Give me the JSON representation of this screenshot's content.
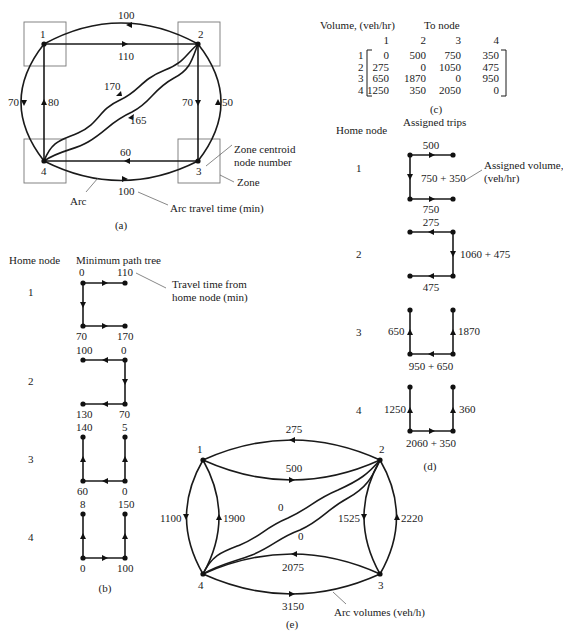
{
  "panel_a": {
    "caption": "(a)",
    "nodes": [
      "1",
      "2",
      "3",
      "4"
    ],
    "arc_times": {
      "outer_2_to_1": "100",
      "inner_1_to_2": "110",
      "outer_1_to_4": "70",
      "inner_4_to_1": "80",
      "diag_4_to_2": "170",
      "diag_2_to_4": "165",
      "inner_2_to_3": "70",
      "outer_3_to_2": "50",
      "inner_3_to_4": "60",
      "outer_4_to_3": "100"
    },
    "annotations": {
      "zone_centroid": "Zone centroid",
      "node_number": "node number",
      "zone": "Zone",
      "arc": "Arc",
      "arc_travel_time": "Arc travel time (min)"
    }
  },
  "panel_b": {
    "caption": "(b)",
    "header_home": "Home node",
    "header_tree": "Minimum path tree",
    "annotation_line1": "Travel time from",
    "annotation_line2": "home node (min)",
    "trees": [
      {
        "home": "1",
        "labels": [
          "0",
          "110",
          "70",
          "170"
        ]
      },
      {
        "home": "2",
        "labels": [
          "100",
          "0",
          "130",
          "70"
        ]
      },
      {
        "home": "3",
        "labels": [
          "140",
          "5",
          "60",
          "0"
        ]
      },
      {
        "home": "4",
        "labels": [
          "8",
          "150",
          "0",
          "100"
        ]
      }
    ]
  },
  "panel_c": {
    "caption": "(c)",
    "title": "Volume, (veh/hr)",
    "header": "To node",
    "columns": [
      "1",
      "2",
      "3",
      "4"
    ],
    "rows": [
      {
        "from": "1",
        "values": [
          "0",
          "500",
          "750",
          "350"
        ]
      },
      {
        "from": "2",
        "values": [
          "275",
          "0",
          "1050",
          "475"
        ]
      },
      {
        "from": "3",
        "values": [
          "650",
          "1870",
          "0",
          "950"
        ]
      },
      {
        "from": "4",
        "values": [
          "1250",
          "350",
          "2050",
          "0"
        ]
      }
    ]
  },
  "panel_d": {
    "caption": "(d)",
    "header_home": "Home node",
    "header_trips": "Assigned trips",
    "annotation_line1": "Assigned volume,",
    "annotation_line2": "(veh/hr)",
    "trees": [
      {
        "home": "1",
        "labels": [
          "500",
          "750 + 350",
          "750"
        ]
      },
      {
        "home": "2",
        "labels": [
          "275",
          "1060 + 475",
          "475"
        ]
      },
      {
        "home": "3",
        "labels": [
          "650",
          "1870",
          "950 + 650"
        ]
      },
      {
        "home": "4",
        "labels": [
          "1250",
          "360",
          "2060 + 350"
        ]
      }
    ]
  },
  "panel_e": {
    "caption": "(e)",
    "nodes": [
      "1",
      "2",
      "3",
      "4"
    ],
    "arc_volumes": {
      "outer_2_to_1": "275",
      "inner_1_to_2": "500",
      "outer_1_to_4": "1100",
      "inner_4_to_1": "1900",
      "diag_upper": "0",
      "diag_lower": "0",
      "inner_2_to_3": "1525",
      "outer_3_to_2": "2220",
      "inner_3_to_4": "2075",
      "outer_4_to_3": "3150"
    },
    "annotation": "Arc volumes (veh/h)"
  }
}
